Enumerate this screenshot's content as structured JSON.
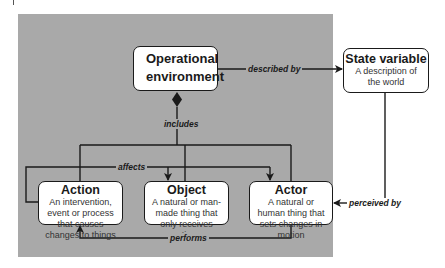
{
  "diagram": {
    "nodes": {
      "operational_environment": {
        "title": "Operational environment"
      },
      "state_variable": {
        "title": "State variable",
        "description": "A description of the world"
      },
      "action": {
        "title": "Action",
        "description": "An intervention, event or process that causes changes to things"
      },
      "object": {
        "title": "Object",
        "description": "A natural or man-made thing that only receives actions"
      },
      "actor": {
        "title": "Actor",
        "description": "A natural or human thing that sets changes in motion"
      }
    },
    "edges": {
      "described_by": {
        "label": "described by",
        "from": "Operational environment",
        "to": "State variable"
      },
      "includes": {
        "label": "includes",
        "from": "Operational environment",
        "to": [
          "Action",
          "Object",
          "Actor"
        ]
      },
      "affects": {
        "label": "affects",
        "from": "Action",
        "to": [
          "Object",
          "Actor"
        ]
      },
      "performs": {
        "label": "performs",
        "from": "Actor",
        "to": "Action"
      },
      "perceived_by": {
        "label": "perceived by",
        "from": "State variable",
        "to": "Actor"
      }
    },
    "colors": {
      "background_panel": "#a9a9a9",
      "box_fill": "#ffffff",
      "line": "#1a1a1a"
    }
  }
}
